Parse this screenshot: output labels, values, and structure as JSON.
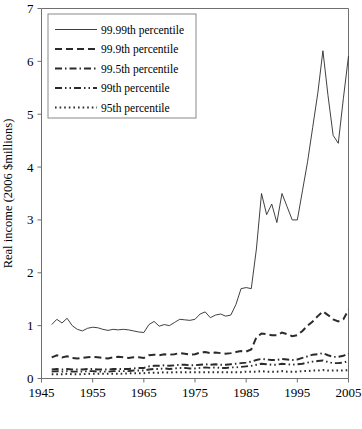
{
  "chart_data": {
    "type": "line",
    "title": "",
    "xlabel": "",
    "ylabel": "Real income (2006 $millions)",
    "xlim": [
      1945,
      2005
    ],
    "ylim": [
      0,
      7
    ],
    "xticks": [
      1945,
      1955,
      1965,
      1975,
      1985,
      1995,
      2005
    ],
    "yticks": [
      0,
      1,
      2,
      3,
      4,
      5,
      6,
      7
    ],
    "grid": false,
    "legend_position": "upper-left",
    "x": [
      1947,
      1948,
      1949,
      1950,
      1951,
      1952,
      1953,
      1954,
      1955,
      1956,
      1957,
      1958,
      1959,
      1960,
      1961,
      1962,
      1963,
      1964,
      1965,
      1966,
      1967,
      1968,
      1969,
      1970,
      1971,
      1972,
      1973,
      1974,
      1975,
      1976,
      1977,
      1978,
      1979,
      1980,
      1981,
      1982,
      1983,
      1984,
      1985,
      1986,
      1987,
      1988,
      1989,
      1990,
      1991,
      1992,
      1993,
      1994,
      1995,
      1996,
      1997,
      1998,
      1999,
      2000,
      2001,
      2002,
      2003,
      2004,
      2005
    ],
    "series": [
      {
        "name": "99.99th percentile",
        "style": "solid",
        "values": [
          1.02,
          1.12,
          1.05,
          1.14,
          1.0,
          0.93,
          0.9,
          0.95,
          0.97,
          0.96,
          0.93,
          0.91,
          0.93,
          0.92,
          0.93,
          0.92,
          0.9,
          0.88,
          0.87,
          1.02,
          1.08,
          0.99,
          1.02,
          1.0,
          1.06,
          1.12,
          1.11,
          1.1,
          1.12,
          1.22,
          1.26,
          1.15,
          1.2,
          1.22,
          1.18,
          1.2,
          1.4,
          1.7,
          1.72,
          1.7,
          2.45,
          3.5,
          3.1,
          3.3,
          2.95,
          3.5,
          3.25,
          3.0,
          3.0,
          3.55,
          4.1,
          4.75,
          5.4,
          6.2,
          5.35,
          4.6,
          4.45,
          5.3,
          6.1
        ]
      },
      {
        "name": "99.9th percentile",
        "style": "dashed",
        "values": [
          0.4,
          0.44,
          0.4,
          0.42,
          0.39,
          0.38,
          0.39,
          0.4,
          0.41,
          0.4,
          0.39,
          0.38,
          0.4,
          0.41,
          0.4,
          0.39,
          0.4,
          0.4,
          0.39,
          0.44,
          0.45,
          0.44,
          0.46,
          0.45,
          0.46,
          0.48,
          0.47,
          0.45,
          0.46,
          0.49,
          0.5,
          0.48,
          0.49,
          0.48,
          0.47,
          0.48,
          0.5,
          0.52,
          0.51,
          0.55,
          0.78,
          0.85,
          0.84,
          0.82,
          0.82,
          0.87,
          0.84,
          0.8,
          0.82,
          0.9,
          1.0,
          1.08,
          1.18,
          1.27,
          1.2,
          1.12,
          1.08,
          1.12,
          1.3
        ]
      },
      {
        "name": "99.5th percentile",
        "style": "dashdot",
        "values": [
          0.17,
          0.18,
          0.17,
          0.18,
          0.17,
          0.17,
          0.17,
          0.18,
          0.18,
          0.17,
          0.17,
          0.17,
          0.18,
          0.18,
          0.18,
          0.18,
          0.19,
          0.2,
          0.2,
          0.23,
          0.24,
          0.24,
          0.25,
          0.24,
          0.25,
          0.26,
          0.26,
          0.25,
          0.25,
          0.26,
          0.27,
          0.26,
          0.27,
          0.26,
          0.26,
          0.27,
          0.28,
          0.29,
          0.3,
          0.32,
          0.35,
          0.37,
          0.36,
          0.35,
          0.35,
          0.37,
          0.36,
          0.35,
          0.36,
          0.39,
          0.42,
          0.45,
          0.46,
          0.48,
          0.44,
          0.41,
          0.41,
          0.43,
          0.47
        ]
      },
      {
        "name": "99th percentile",
        "style": "dashdotdot",
        "values": [
          0.13,
          0.14,
          0.13,
          0.14,
          0.13,
          0.13,
          0.13,
          0.14,
          0.14,
          0.13,
          0.13,
          0.13,
          0.14,
          0.14,
          0.14,
          0.14,
          0.15,
          0.15,
          0.15,
          0.17,
          0.18,
          0.18,
          0.19,
          0.18,
          0.19,
          0.2,
          0.2,
          0.19,
          0.19,
          0.2,
          0.21,
          0.2,
          0.21,
          0.2,
          0.2,
          0.21,
          0.21,
          0.22,
          0.23,
          0.24,
          0.26,
          0.28,
          0.27,
          0.26,
          0.26,
          0.28,
          0.27,
          0.26,
          0.27,
          0.28,
          0.3,
          0.32,
          0.33,
          0.34,
          0.31,
          0.29,
          0.29,
          0.3,
          0.33
        ]
      },
      {
        "name": "95th percentile",
        "style": "dotted",
        "values": [
          0.08,
          0.08,
          0.08,
          0.09,
          0.08,
          0.08,
          0.08,
          0.09,
          0.09,
          0.09,
          0.09,
          0.09,
          0.09,
          0.09,
          0.09,
          0.1,
          0.1,
          0.1,
          0.1,
          0.11,
          0.11,
          0.11,
          0.12,
          0.11,
          0.12,
          0.12,
          0.12,
          0.12,
          0.12,
          0.12,
          0.12,
          0.12,
          0.12,
          0.12,
          0.12,
          0.12,
          0.12,
          0.12,
          0.13,
          0.13,
          0.13,
          0.14,
          0.13,
          0.13,
          0.13,
          0.14,
          0.13,
          0.13,
          0.13,
          0.14,
          0.14,
          0.15,
          0.15,
          0.16,
          0.15,
          0.15,
          0.15,
          0.15,
          0.16
        ]
      }
    ]
  }
}
